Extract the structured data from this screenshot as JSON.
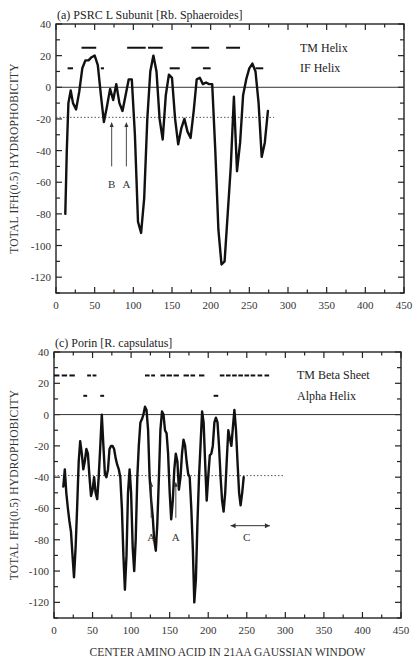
{
  "chart_data": [
    {
      "type": "line",
      "title": "(a) PSRC L Subunit [Rb. Sphaeroides]",
      "xlabel": "",
      "ylabel": "TOTAL IFH(0.5) HYDROPHOBICITY",
      "xlim": [
        0,
        450
      ],
      "ylim": [
        -130,
        40
      ],
      "x_ticks": [
        0,
        50,
        100,
        150,
        200,
        250,
        300,
        350,
        400,
        450
      ],
      "y_ticks": [
        40,
        20,
        0,
        -20,
        -40,
        -60,
        -80,
        -100,
        -120
      ],
      "zero_line": 0,
      "threshold_line": -19,
      "series": [
        {
          "name": "Hydrophobicity",
          "x": [
            12,
            14,
            16,
            19,
            22,
            26,
            30,
            34,
            38,
            42,
            46,
            50,
            54,
            58,
            62,
            66,
            70,
            74,
            78,
            82,
            86,
            90,
            94,
            98,
            102,
            106,
            110,
            114,
            118,
            122,
            126,
            130,
            134,
            138,
            142,
            146,
            150,
            154,
            158,
            162,
            166,
            170,
            174,
            178,
            182,
            186,
            190,
            194,
            198,
            202,
            206,
            210,
            214,
            218,
            222,
            226,
            230,
            234,
            238,
            242,
            246,
            250,
            254,
            258,
            262,
            266,
            270,
            274
          ],
          "values": [
            -80,
            -40,
            -10,
            -2,
            -10,
            -14,
            -3,
            12,
            17,
            17,
            19,
            20,
            14,
            -5,
            -22,
            -12,
            -1,
            -8,
            2,
            -10,
            -15,
            -5,
            5,
            5,
            -30,
            -85,
            -92,
            -70,
            -20,
            10,
            20,
            10,
            -20,
            -33,
            -5,
            8,
            6,
            -20,
            -36,
            -26,
            -20,
            -28,
            -32,
            -15,
            5,
            6,
            2,
            3,
            2,
            2,
            -40,
            -90,
            -112,
            -110,
            -80,
            -50,
            -6,
            -53,
            -35,
            -5,
            5,
            12,
            15,
            10,
            -10,
            -44,
            -35,
            -15
          ]
        }
      ],
      "legend": [
        {
          "label": "TM Helix",
          "style": "dash-row",
          "y": 25
        },
        {
          "label": "IF Helix",
          "style": "dash-row",
          "y": 12
        }
      ],
      "tm_segments_y": 25,
      "tm_segments": [
        [
          33,
          52
        ],
        [
          92,
          116
        ],
        [
          119,
          138
        ],
        [
          175,
          198
        ],
        [
          220,
          238
        ]
      ],
      "if_segments_y": 12,
      "if_segments": [
        [
          15,
          22
        ],
        [
          58,
          62
        ],
        [
          147,
          160
        ],
        [
          190,
          200
        ],
        [
          258,
          268
        ]
      ],
      "annotations": [
        {
          "label": "B",
          "x": 72,
          "y_text": -61,
          "arrow_from": -50,
          "arrow_to": -22
        },
        {
          "label": "A",
          "x": 91,
          "y_text": -61,
          "arrow_from": -50,
          "arrow_to": -22
        }
      ]
    },
    {
      "type": "line",
      "title": "(c) Porin [R. capsulatus]",
      "xlabel": "CENTER AMINO ACID IN 21AA GAUSSIAN WINDOW",
      "ylabel": "TOTAL IFH(0.5) HYDROPHOBICITY",
      "xlim": [
        0,
        450
      ],
      "ylim": [
        -130,
        40
      ],
      "x_ticks": [
        0,
        50,
        100,
        150,
        200,
        250,
        300,
        350,
        400,
        450
      ],
      "y_ticks": [
        40,
        20,
        0,
        -20,
        -40,
        -60,
        -80,
        -100,
        -120
      ],
      "zero_line": 0,
      "threshold_line": -39,
      "series": [
        {
          "name": "Hydrophobicity",
          "x": [
            12,
            14,
            16,
            18,
            20,
            22,
            24,
            26,
            28,
            30,
            32,
            34,
            36,
            38,
            40,
            42,
            44,
            46,
            48,
            50,
            52,
            54,
            56,
            58,
            60,
            62,
            64,
            66,
            68,
            70,
            72,
            74,
            76,
            78,
            80,
            82,
            84,
            86,
            88,
            90,
            92,
            94,
            96,
            98,
            100,
            102,
            104,
            106,
            108,
            110,
            112,
            114,
            116,
            118,
            120,
            122,
            124,
            126,
            128,
            130,
            132,
            134,
            136,
            138,
            140,
            142,
            144,
            146,
            148,
            150,
            152,
            154,
            156,
            158,
            160,
            162,
            164,
            166,
            168,
            170,
            172,
            174,
            176,
            178,
            180,
            182,
            184,
            186,
            188,
            190,
            192,
            194,
            196,
            198,
            200,
            202,
            204,
            206,
            208,
            210,
            212,
            214,
            216,
            218,
            220,
            222,
            224,
            226,
            228,
            230,
            232,
            234,
            236,
            238,
            240,
            242,
            244,
            246,
            248,
            250,
            252,
            254,
            256,
            258,
            260,
            262,
            264,
            266,
            268,
            270,
            272,
            274,
            276,
            278,
            280,
            282,
            284,
            286,
            288,
            290
          ],
          "values": [
            -46,
            -35,
            -50,
            -60,
            -68,
            -75,
            -90,
            -104,
            -85,
            -60,
            -30,
            -17,
            -25,
            -35,
            -30,
            -22,
            -25,
            -40,
            -52,
            -48,
            -40,
            -50,
            -54,
            -40,
            -20,
            0,
            -20,
            -38,
            -40,
            -35,
            -22,
            -20,
            -20,
            -22,
            -28,
            -32,
            -35,
            -40,
            -60,
            -90,
            -112,
            -90,
            -50,
            -35,
            -50,
            -85,
            -100,
            -80,
            -40,
            -20,
            -5,
            -3,
            0,
            5,
            3,
            -10,
            -40,
            -55,
            -65,
            -80,
            -87,
            -70,
            -40,
            -10,
            2,
            0,
            -10,
            -12,
            -25,
            -50,
            -67,
            -55,
            -35,
            -25,
            -30,
            -48,
            -40,
            -25,
            -16,
            -20,
            -30,
            -38,
            -40,
            -60,
            -85,
            -120,
            -105,
            -70,
            -40,
            -20,
            2,
            -5,
            -30,
            -55,
            -40,
            -26,
            -25,
            -20,
            -5,
            -2,
            -5,
            -20,
            -40,
            -55,
            -62,
            -50,
            -30,
            -10,
            -15,
            -20,
            -8,
            3,
            -10,
            -30,
            -50,
            -58,
            -50,
            -40
          ]
        }
      ],
      "legend": [
        {
          "label": "TM Beta Sheet",
          "style": "dash-row",
          "y": 25
        },
        {
          "label": "Alpha Helix",
          "style": "dash-row",
          "y": 12
        }
      ],
      "tm_segments_y": 25,
      "tm_segments": [
        [
          0,
          7
        ],
        [
          10,
          17
        ],
        [
          20,
          27
        ],
        [
          43,
          48
        ],
        [
          50,
          55
        ],
        [
          118,
          124
        ],
        [
          126,
          131
        ],
        [
          138,
          144
        ],
        [
          146,
          153
        ],
        [
          155,
          162
        ],
        [
          168,
          175
        ],
        [
          177,
          183
        ],
        [
          188,
          195
        ],
        [
          215,
          221
        ],
        [
          223,
          229
        ],
        [
          231,
          237
        ],
        [
          239,
          245
        ],
        [
          247,
          253
        ],
        [
          255,
          261
        ],
        [
          264,
          270
        ],
        [
          273,
          279
        ]
      ],
      "if_segments_y": 12,
      "if_segments": [
        [
          38,
          43
        ],
        [
          60,
          65
        ],
        [
          207,
          213
        ]
      ],
      "annotations": [
        {
          "label": "A",
          "x": 126,
          "y_text": -78,
          "arrow_from": -66,
          "arrow_to": -43
        },
        {
          "label": "A",
          "x": 158,
          "y_text": -78,
          "arrow_from": -66,
          "arrow_to": -43
        },
        {
          "label": "C",
          "x": 250,
          "y_text": -78,
          "range": [
            229,
            280
          ],
          "range_y": -71
        }
      ]
    }
  ]
}
